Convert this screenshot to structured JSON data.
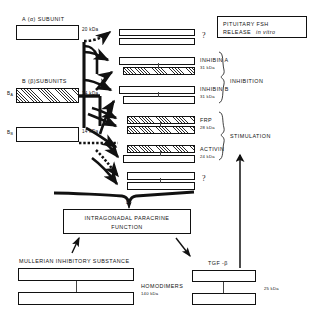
{
  "figure": {
    "title_note": "Inhibin/activin family subunit dimerization schematic",
    "top_right_box": {
      "line1": "PITUITARY FSH",
      "line2_main": "RELEASE",
      "line2_italic": "in vitro"
    },
    "subunit_groups": [
      {
        "id": "alpha",
        "heading_prefix": "A (",
        "heading_greek": "α",
        "heading_suffix": ") SUBUNIT",
        "mass": "20 kDa",
        "fill": "plain"
      },
      {
        "id": "beta",
        "heading_prefix": "B (",
        "heading_greek": "β",
        "heading_suffix": ")SUBUNITS",
        "members": [
          {
            "label": "B",
            "subscript": "A",
            "mass": "14 kDa",
            "fill": "hatch"
          },
          {
            "label": "B",
            "subscript": "B",
            "mass": "14 kDa",
            "fill": "plain"
          }
        ]
      }
    ],
    "dimers": [
      {
        "name": "?",
        "mass": "",
        "top_fill": "plain",
        "bottom_fill": "plain",
        "is_query": true
      },
      {
        "name": "INHIBIN A",
        "mass": "31 kDa",
        "top_fill": "plain",
        "bottom_fill": "hatch",
        "is_query": false
      },
      {
        "name": "INHIBIN B",
        "mass": "31 kDa",
        "top_fill": "plain",
        "bottom_fill": "plain",
        "is_query": false
      },
      {
        "name": "FRP",
        "mass": "28 kDa",
        "top_fill": "hatch",
        "bottom_fill": "hatch",
        "is_query": false
      },
      {
        "name": "ACTIVIN",
        "mass": "24 kDa",
        "top_fill": "hatch",
        "bottom_fill": "plain",
        "is_query": false
      },
      {
        "name": "?",
        "mass": "",
        "top_fill": "plain",
        "bottom_fill": "plain",
        "is_query": true
      }
    ],
    "brace_labels": [
      {
        "id": "inhibition",
        "text": "INHIBITION"
      },
      {
        "id": "stimulation",
        "text": "STIMULATION"
      }
    ],
    "brace_query": "?",
    "paracrine_box": {
      "line1": "INTRAGONADAL PARACRINE",
      "line2": "FUNCTION"
    },
    "bottom_left": {
      "heading": "MULLERIAN INHIBITORY SUBSTANCE",
      "group_label": "HOMODIMERS",
      "mass": "140 kDa"
    },
    "bottom_right": {
      "heading": "TGF -β",
      "mass": "25 kDa"
    },
    "colors": {
      "ink": "#111111",
      "paper": "#ffffff",
      "hatch": "#2b2b2b"
    }
  }
}
